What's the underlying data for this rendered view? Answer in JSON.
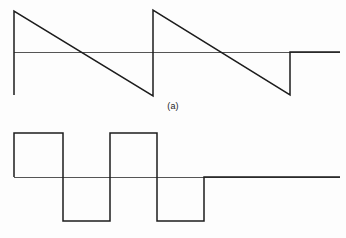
{
  "figure": {
    "background_color": "#fdfdfd",
    "signal_color": "#1c1c1c",
    "axis_color": "#555555",
    "panels": [
      {
        "id": "a",
        "caption": "(a)",
        "waveform_name": "sawtooth-wave"
      },
      {
        "id": "b",
        "caption": "(b)",
        "waveform_name": "square-wave"
      }
    ]
  },
  "chart_data": [
    {
      "type": "line",
      "id": "panel-a",
      "title": "",
      "subtitle": "",
      "xlabel": "",
      "ylabel": "",
      "annotations": [
        "(a)"
      ],
      "waveform": "sawtooth",
      "cycles": 2,
      "grid": false,
      "legend": null,
      "axis": {
        "baseline_y": 52,
        "x_start": 14,
        "x_end": 340
      },
      "series": [
        {
          "name": "sawtooth",
          "points": [
            [
              14,
              95
            ],
            [
              14,
              11
            ],
            [
              153,
              96
            ],
            [
              153,
              10
            ],
            [
              290,
              95
            ],
            [
              290,
              52
            ],
            [
              340,
              52
            ]
          ]
        }
      ],
      "xlim": [
        0,
        346
      ],
      "ylim": [
        119,
        0
      ]
    },
    {
      "type": "line",
      "id": "panel-b",
      "title": "",
      "subtitle": "",
      "xlabel": "",
      "ylabel": "",
      "annotations": [
        "(b)"
      ],
      "waveform": "square",
      "cycles": 2,
      "grid": false,
      "legend": null,
      "axis": {
        "baseline_y": 58,
        "x_start": 14,
        "x_end": 340
      },
      "series": [
        {
          "name": "square",
          "points": [
            [
              14,
              58
            ],
            [
              14,
              14
            ],
            [
              63,
              14
            ],
            [
              63,
              102
            ],
            [
              110,
              102
            ],
            [
              110,
              14
            ],
            [
              157,
              14
            ],
            [
              157,
              102
            ],
            [
              204,
              102
            ],
            [
              204,
              58
            ],
            [
              340,
              58
            ]
          ]
        }
      ],
      "xlim": [
        0,
        346
      ],
      "ylim": [
        119,
        0
      ]
    }
  ]
}
